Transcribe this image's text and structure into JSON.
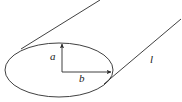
{
  "figure": {
    "width": 182,
    "height": 102,
    "background_color": "#ffffff",
    "stroke_color": "#2b2b2b",
    "stroke_width": 0.9
  },
  "labels": {
    "semi_minor_vertical": "a",
    "semi_major_horizontal": "b",
    "slant_line": "l"
  },
  "shapes": {
    "ellipse": {
      "name": "base-ellipse",
      "center_x": 59,
      "center_y": 70,
      "radius_x": 54,
      "radius_y": 27
    },
    "arrow_vertical": {
      "name": "semi-axis-a-arrow",
      "from_x": 62,
      "from_y": 72,
      "to_x": 62,
      "to_y": 43
    },
    "arrow_horizontal": {
      "name": "semi-axis-b-arrow",
      "from_x": 62,
      "from_y": 72,
      "to_x": 112,
      "to_y": 72
    },
    "tangent_upper": {
      "name": "upper-tangent-line",
      "from_x": 21,
      "from_y": 49,
      "to_x": 100,
      "to_y": 0
    },
    "tangent_lower": {
      "name": "lower-tangent-line",
      "from_x": 104,
      "from_y": 84,
      "to_x": 181,
      "to_y": 19
    }
  }
}
